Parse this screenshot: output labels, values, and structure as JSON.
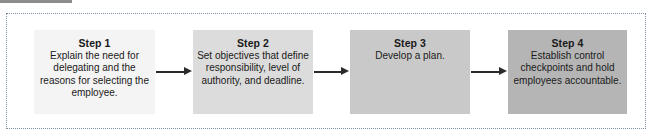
{
  "figure": {
    "type": "process-flow-diagram",
    "frame_border_color": "#7d8fa0",
    "background_color": "#ffffff",
    "arrow_color": "#2b2b2b",
    "steps": [
      {
        "title": "Step 1",
        "description": "Explain the need for delegating and the reasons for selecting the employee.",
        "fill_color": "#f4f4f4"
      },
      {
        "title": "Step 2",
        "description": "Set objectives that define responsibility, level of authority, and deadline.",
        "fill_color": "#dcdcdc"
      },
      {
        "title": "Step 3",
        "description": "Develop a plan.",
        "fill_color": "#c9c9c9"
      },
      {
        "title": "Step 4",
        "description": "Establish control checkpoints and hold employees accountable.",
        "fill_color": "#b5b5b5"
      }
    ],
    "connectors": [
      {
        "label": "arrow-step1-to-step2"
      },
      {
        "label": "arrow-step2-to-step3"
      },
      {
        "label": "arrow-step3-to-step4"
      }
    ]
  }
}
